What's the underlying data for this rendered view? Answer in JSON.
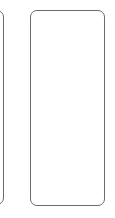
{
  "cards": [
    {
      "id": "left",
      "label": "",
      "border_color": "#6b6b6b",
      "partially_visible": true
    },
    {
      "id": "right",
      "label": "",
      "border_color": "#6b6b6b",
      "partially_visible": false
    }
  ]
}
